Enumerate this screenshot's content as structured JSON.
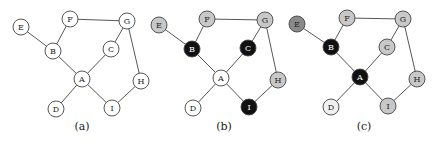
{
  "figure": {
    "panels": [
      {
        "caption": "(a)",
        "caption_pos": [
          82,
          130
        ],
        "nodes": [
          {
            "id": "E",
            "x": 21,
            "y": 27,
            "fill": "#ffffff"
          },
          {
            "id": "F",
            "x": 70,
            "y": 19,
            "fill": "#ffffff"
          },
          {
            "id": "G",
            "x": 127,
            "y": 21,
            "fill": "#ffffff"
          },
          {
            "id": "B",
            "x": 53,
            "y": 51,
            "fill": "#ffffff"
          },
          {
            "id": "C",
            "x": 111,
            "y": 49,
            "fill": "#ffffff"
          },
          {
            "id": "A",
            "x": 82,
            "y": 79,
            "fill": "#ffffff"
          },
          {
            "id": "H",
            "x": 141,
            "y": 81,
            "fill": "#ffffff"
          },
          {
            "id": "D",
            "x": 56,
            "y": 109,
            "fill": "#ffffff"
          },
          {
            "id": "I",
            "x": 112,
            "y": 108,
            "fill": "#ffffff"
          }
        ]
      },
      {
        "caption": "(b)",
        "caption_pos": [
          224,
          130
        ],
        "nodes": [
          {
            "id": "E",
            "x": 159,
            "y": 25,
            "fill": "#c8c8c8"
          },
          {
            "id": "F",
            "x": 207,
            "y": 19,
            "fill": "#c8c8c8"
          },
          {
            "id": "G",
            "x": 265,
            "y": 20,
            "fill": "#c8c8c8"
          },
          {
            "id": "B",
            "x": 192,
            "y": 49,
            "fill": "#111111"
          },
          {
            "id": "C",
            "x": 248,
            "y": 48,
            "fill": "#111111"
          },
          {
            "id": "A",
            "x": 221,
            "y": 78,
            "fill": "#ffffff"
          },
          {
            "id": "H",
            "x": 278,
            "y": 80,
            "fill": "#c8c8c8"
          },
          {
            "id": "D",
            "x": 193,
            "y": 108,
            "fill": "#ffffff"
          },
          {
            "id": "I",
            "x": 249,
            "y": 107,
            "fill": "#111111"
          }
        ]
      },
      {
        "caption": "(c)",
        "caption_pos": [
          364,
          130
        ],
        "nodes": [
          {
            "id": "E",
            "x": 297,
            "y": 24,
            "fill": "#8a8a8a"
          },
          {
            "id": "F",
            "x": 347,
            "y": 18,
            "fill": "#c8c8c8"
          },
          {
            "id": "G",
            "x": 403,
            "y": 19,
            "fill": "#c8c8c8"
          },
          {
            "id": "B",
            "x": 331,
            "y": 47,
            "fill": "#111111"
          },
          {
            "id": "C",
            "x": 387,
            "y": 47,
            "fill": "#c8c8c8"
          },
          {
            "id": "A",
            "x": 360,
            "y": 77,
            "fill": "#111111"
          },
          {
            "id": "H",
            "x": 417,
            "y": 79,
            "fill": "#c8c8c8"
          },
          {
            "id": "D",
            "x": 331,
            "y": 107,
            "fill": "#f0f0f0"
          },
          {
            "id": "I",
            "x": 388,
            "y": 106,
            "fill": "#c8c8c8"
          }
        ]
      }
    ],
    "edges": [
      [
        "E",
        "B"
      ],
      [
        "F",
        "B"
      ],
      [
        "F",
        "G"
      ],
      [
        "G",
        "C"
      ],
      [
        "G",
        "H"
      ],
      [
        "B",
        "A"
      ],
      [
        "C",
        "A"
      ],
      [
        "A",
        "D"
      ],
      [
        "A",
        "I"
      ],
      [
        "I",
        "H"
      ]
    ],
    "node_radius": 8,
    "colors": {
      "white": "#ffffff",
      "light_gray": "#c8c8c8",
      "dark_gray": "#8a8a8a",
      "black": "#111111",
      "stroke": "#444444"
    }
  }
}
